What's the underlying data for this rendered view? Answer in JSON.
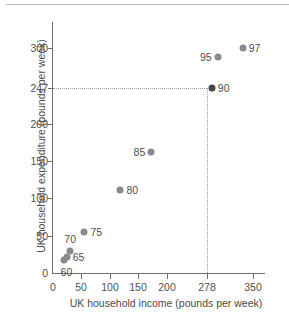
{
  "chart_data": {
    "type": "scatter",
    "title": "",
    "xlabel": "UK household income (pounds per week)",
    "ylabel": "UK household expenditure (pounds per week)",
    "xlim": [
      0,
      375
    ],
    "ylim": [
      0,
      325
    ],
    "xticks": [
      "0",
      "50",
      "100",
      "150",
      "200",
      "278",
      "350"
    ],
    "xtick_values": [
      0,
      50,
      100,
      150,
      200,
      278,
      350
    ],
    "yticks": [
      "0",
      "50",
      "100",
      "150",
      "200",
      "247",
      "300"
    ],
    "ytick_values": [
      0,
      50,
      100,
      150,
      200,
      247,
      300
    ],
    "grid": false,
    "legend": null,
    "point_label_key": "year",
    "points": [
      {
        "label": "60",
        "x": 20,
        "y": 18,
        "label_pos": "below"
      },
      {
        "label": "65",
        "x": 24,
        "y": 22,
        "label_pos": "right"
      },
      {
        "label": "70",
        "x": 30,
        "y": 30,
        "label_pos": "above"
      },
      {
        "label": "75",
        "x": 55,
        "y": 55,
        "label_pos": "right"
      },
      {
        "label": "80",
        "x": 118,
        "y": 111,
        "label_pos": "right"
      },
      {
        "label": "85",
        "x": 172,
        "y": 162,
        "label_pos": "left"
      },
      {
        "label": "90",
        "x": 278,
        "y": 247,
        "label_pos": "right",
        "highlight": true
      },
      {
        "label": "95",
        "x": 288,
        "y": 288,
        "label_pos": "left"
      },
      {
        "label": "97",
        "x": 332,
        "y": 300,
        "label_pos": "right"
      }
    ],
    "annotations": [
      {
        "name": "guide-horizontal",
        "value": 247,
        "axis": "y",
        "style": "dotted",
        "from": 0,
        "to": 278
      },
      {
        "name": "guide-vertical",
        "value": 278,
        "axis": "x",
        "style": "dotted",
        "from": 0,
        "to": 247
      }
    ],
    "colors": {
      "point": "#8a8a8a",
      "point_highlight": "#454545",
      "axis": "#6e6e6e",
      "guide": "#9a9a9a",
      "text": "#4f4f4f",
      "background": "#ffffff"
    }
  }
}
